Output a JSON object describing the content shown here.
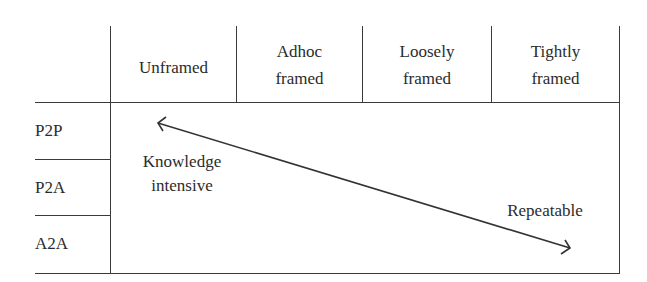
{
  "diagram": {
    "columns": [
      {
        "line1": "Unframed",
        "line2": ""
      },
      {
        "line1": "Adhoc",
        "line2": "framed"
      },
      {
        "line1": "Loosely",
        "line2": "framed"
      },
      {
        "line1": "Tightly",
        "line2": "framed"
      }
    ],
    "rows": [
      "P2P",
      "P2A",
      "A2A"
    ],
    "arrow": {
      "start_label": {
        "line1": "Knowledge",
        "line2": "intensive"
      },
      "end_label": "Repeatable",
      "direction": "bidirectional"
    },
    "colors": {
      "line": "#3a3a3a",
      "text": "#2b2b2b",
      "background": "#ffffff"
    }
  }
}
